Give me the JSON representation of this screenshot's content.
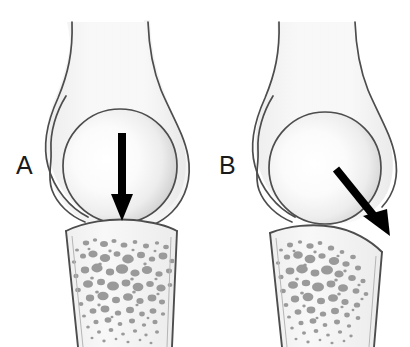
{
  "figure": {
    "background_color": "#ffffff",
    "width": 410,
    "height": 347
  },
  "colors": {
    "outline": "#4d4d4d",
    "outline_dark": "#3a3a3a",
    "bone_fill": "#f4f4f4",
    "head_highlight": "#ffffff",
    "head_shadow": "#b9b9b9",
    "trabecula": "#9a9a9a",
    "arrow": "#000000",
    "label": "#1a1a1a"
  },
  "panels": [
    {
      "id": "panel-a",
      "label": "A",
      "label_x": 16,
      "label_y": 173,
      "force": {
        "name": "axial-compressive-force",
        "direction": "down",
        "angle_deg": 90,
        "start": [
          122,
          133
        ],
        "end": [
          122,
          221
        ],
        "shaft_width": 8,
        "head_width": 22,
        "head_length": 26
      },
      "joint": {
        "head_center": [
          120,
          166
        ],
        "head_radius": 57
      }
    },
    {
      "id": "panel-b",
      "label": "B",
      "label_x": 219,
      "label_y": 173,
      "force": {
        "name": "oblique-shear-force",
        "direction": "down-right",
        "angle_deg": 51,
        "start": [
          336,
          169
        ],
        "end": [
          390,
          236
        ],
        "shaft_width": 8,
        "head_width": 24,
        "head_length": 28
      },
      "joint": {
        "head_center": [
          325,
          168
        ],
        "head_radius": 56
      }
    }
  ],
  "trabeculae": {
    "name": "cancellous-bone-texture",
    "fill": "#9a9a9a",
    "panel_a_count": 150,
    "panel_b_count": 150
  }
}
